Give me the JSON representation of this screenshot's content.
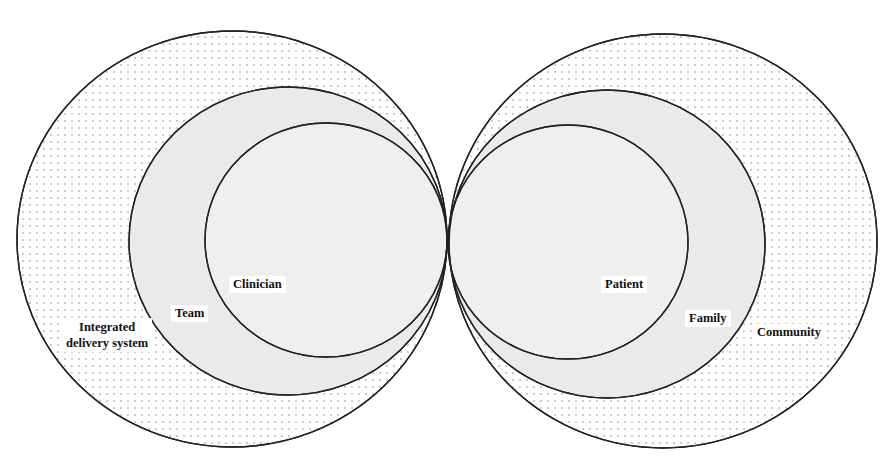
{
  "diagram": {
    "left_group": {
      "outer_label_line1": "Integrated",
      "outer_label_line2": "delivery system",
      "middle_label": "Team",
      "inner_label": "Clinician"
    },
    "right_group": {
      "inner_label": "Patient",
      "middle_label": "Family",
      "outer_label": "Community"
    },
    "colors": {
      "stroke": "#222222",
      "outer_fill": "#ffffff",
      "dot": "#8a8a8a",
      "middle_fill": "#eeeeee",
      "inner_fill": "#f3f3f3"
    }
  }
}
